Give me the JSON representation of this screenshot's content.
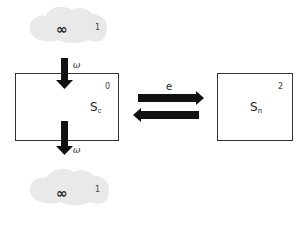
{
  "diagram": {
    "type": "stock-and-flow",
    "sources": [
      {
        "id": "top-cloud",
        "symbol": "∞",
        "number": "1"
      },
      {
        "id": "bottom-cloud",
        "symbol": "∞",
        "number": "1"
      }
    ],
    "stocks": [
      {
        "id": "sc",
        "label_main": "S",
        "label_sub": "c",
        "number": "0"
      },
      {
        "id": "sn",
        "label_main": "S",
        "label_sub": "n",
        "number": "2"
      }
    ],
    "flows": [
      {
        "from": "top-cloud",
        "to": "sc",
        "label": "ω"
      },
      {
        "from": "sc",
        "to": "bottom-cloud",
        "label": "ω"
      }
    ],
    "exchange": {
      "between": [
        "sc",
        "sn"
      ],
      "label": "e"
    }
  },
  "colors": {
    "arrow": "#111111",
    "box_border": "#333333",
    "cloud": "#e8e8e8"
  }
}
